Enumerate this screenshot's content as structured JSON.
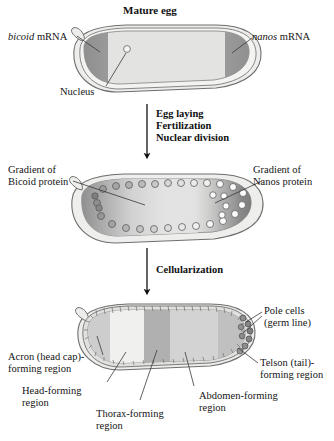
{
  "figure": {
    "title": "Mature egg"
  },
  "stage1": {
    "title": "Mature egg",
    "labels": {
      "bicoid_italic": "bicoid",
      "bicoid_rest": " mRNA",
      "nanos_italic": "nanos",
      "nanos_rest": " mRNA",
      "nucleus": "Nucleus"
    }
  },
  "arrow1": {
    "line1": "Egg laying",
    "line2": "Fertilization",
    "line3": "Nuclear division"
  },
  "stage2": {
    "labels": {
      "bicoid_gradient_line1": "Gradient of",
      "bicoid_gradient_line2": "Bicoid protein",
      "nanos_gradient_line1": "Gradient of",
      "nanos_gradient_line2": "Nanos protein"
    }
  },
  "arrow2": {
    "line1": "Cellularization"
  },
  "stage3": {
    "labels": {
      "pole_cells_line1": "Pole cells",
      "pole_cells_line2": "(germ line)",
      "acron_line1": "Acron (head cap)-",
      "acron_line2": "forming region",
      "telson_line1": "Telson (tail)-",
      "telson_line2": "forming region",
      "head_line1": "Head-forming",
      "head_line2": "region",
      "thorax_line1": "Thorax-forming",
      "thorax_line2": "region",
      "abdomen_line1": "Abdomen-forming",
      "abdomen_line2": "region"
    }
  },
  "colors": {
    "outline": "#6b6b6b",
    "chorion": "#e8e8e6",
    "cytoplasm": "#dedede",
    "mrna_dark": "#8f8f8f",
    "band_acron": "#cfcfcf",
    "band_head": "#efefef",
    "band_thorax": "#b2b2b2",
    "band_abdomen": "#d2d2d2",
    "band_telson": "#c2c2c2",
    "pole_cells": "#8a8a8a",
    "text": "#151515"
  }
}
